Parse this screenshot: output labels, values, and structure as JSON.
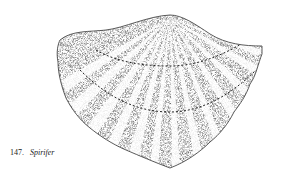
{
  "figure": {
    "number": "147.",
    "name": "Spirifer",
    "colors": {
      "ink": "#1a1a1a",
      "paper": "#ffffff"
    }
  }
}
